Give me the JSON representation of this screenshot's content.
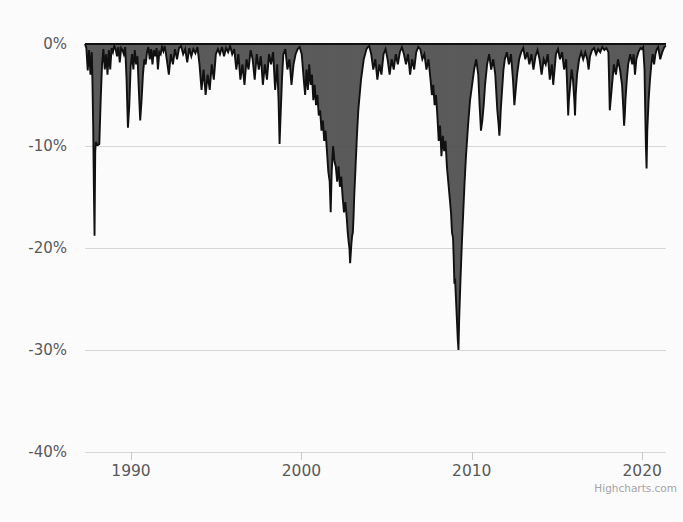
{
  "chart": {
    "credit": "Highcharts.com",
    "background_color": "#fdfdfd",
    "area_fill_color": "#4d4d4d",
    "line_color": "#111111",
    "gridline_color": "#d8d8d8",
    "axis_label_color": "#5a5a5a"
  },
  "chart_data": {
    "type": "area",
    "title": "",
    "subtitle": "",
    "xlabel": "",
    "ylabel": "",
    "xlim": [
      1987.3,
      2021.4
    ],
    "ylim": [
      -40,
      0
    ],
    "x_tick_labels": [
      "1990",
      "2000",
      "2010",
      "2020"
    ],
    "x_ticks": [
      1990,
      2000,
      2010,
      2020
    ],
    "y_tick_labels": [
      "0%",
      "-10%",
      "-20%",
      "-30%",
      "-40%"
    ],
    "y_ticks": [
      0,
      -10,
      -20,
      -30,
      -40
    ],
    "grid": "horizontal",
    "legend": "none",
    "series": [
      {
        "name": "Drawdown",
        "x": [
          1987.3,
          1987.38,
          1987.46,
          1987.54,
          1987.62,
          1987.7,
          1987.74,
          1987.78,
          1987.82,
          1987.86,
          1987.9,
          1987.94,
          1987.98,
          1988.06,
          1988.14,
          1988.22,
          1988.3,
          1988.38,
          1988.46,
          1988.54,
          1988.62,
          1988.7,
          1988.78,
          1988.86,
          1988.94,
          1989.02,
          1989.1,
          1989.18,
          1989.26,
          1989.34,
          1989.42,
          1989.5,
          1989.58,
          1989.66,
          1989.74,
          1989.82,
          1989.9,
          1989.98,
          1990.06,
          1990.14,
          1990.22,
          1990.3,
          1990.38,
          1990.46,
          1990.54,
          1990.62,
          1990.7,
          1990.78,
          1990.86,
          1990.94,
          1991.02,
          1991.1,
          1991.18,
          1991.26,
          1991.34,
          1991.42,
          1991.5,
          1991.58,
          1991.66,
          1991.74,
          1991.82,
          1991.9,
          1991.98,
          1992.1,
          1992.22,
          1992.34,
          1992.46,
          1992.58,
          1992.7,
          1992.82,
          1992.94,
          1993.06,
          1993.18,
          1993.3,
          1993.42,
          1993.54,
          1993.66,
          1993.78,
          1993.9,
          1994.02,
          1994.14,
          1994.26,
          1994.38,
          1994.5,
          1994.62,
          1994.74,
          1994.86,
          1994.98,
          1995.1,
          1995.22,
          1995.34,
          1995.46,
          1995.58,
          1995.7,
          1995.82,
          1995.94,
          1996.06,
          1996.18,
          1996.3,
          1996.42,
          1996.54,
          1996.66,
          1996.78,
          1996.9,
          1997.02,
          1997.14,
          1997.26,
          1997.38,
          1997.5,
          1997.62,
          1997.74,
          1997.86,
          1997.98,
          1998.1,
          1998.22,
          1998.34,
          1998.46,
          1998.58,
          1998.66,
          1998.72,
          1998.78,
          1998.86,
          1998.94,
          1999.06,
          1999.18,
          1999.3,
          1999.42,
          1999.54,
          1999.66,
          1999.78,
          1999.9,
          2000.02,
          2000.14,
          2000.22,
          2000.3,
          2000.38,
          2000.46,
          2000.54,
          2000.62,
          2000.7,
          2000.78,
          2000.86,
          2000.94,
          2001.02,
          2001.1,
          2001.18,
          2001.26,
          2001.34,
          2001.42,
          2001.5,
          2001.58,
          2001.66,
          2001.72,
          2001.78,
          2001.86,
          2001.94,
          2002.02,
          2002.1,
          2002.18,
          2002.26,
          2002.34,
          2002.42,
          2002.5,
          2002.58,
          2002.66,
          2002.72,
          2002.78,
          2002.82,
          2002.86,
          2002.9,
          2002.94,
          2002.98,
          2003.02,
          2003.06,
          2003.1,
          2003.14,
          2003.18,
          2003.26,
          2003.34,
          2003.42,
          2003.5,
          2003.58,
          2003.66,
          2003.74,
          2003.82,
          2003.9,
          2003.98,
          2004.1,
          2004.22,
          2004.34,
          2004.46,
          2004.58,
          2004.7,
          2004.82,
          2004.94,
          2005.06,
          2005.18,
          2005.3,
          2005.42,
          2005.54,
          2005.66,
          2005.78,
          2005.9,
          2006.02,
          2006.14,
          2006.26,
          2006.38,
          2006.5,
          2006.62,
          2006.74,
          2006.86,
          2006.98,
          2007.1,
          2007.22,
          2007.34,
          2007.46,
          2007.58,
          2007.66,
          2007.74,
          2007.82,
          2007.9,
          2007.98,
          2008.06,
          2008.14,
          2008.22,
          2008.3,
          2008.38,
          2008.46,
          2008.54,
          2008.62,
          2008.7,
          2008.78,
          2008.84,
          2008.9,
          2008.94,
          2008.98,
          2009.02,
          2009.06,
          2009.1,
          2009.14,
          2009.18,
          2009.22,
          2009.26,
          2009.34,
          2009.42,
          2009.5,
          2009.58,
          2009.66,
          2009.78,
          2009.9,
          2010.02,
          2010.14,
          2010.26,
          2010.38,
          2010.46,
          2010.54,
          2010.62,
          2010.7,
          2010.78,
          2010.9,
          2011.02,
          2011.14,
          2011.26,
          2011.38,
          2011.5,
          2011.58,
          2011.62,
          2011.66,
          2011.7,
          2011.78,
          2011.86,
          2011.94,
          2012.06,
          2012.18,
          2012.3,
          2012.42,
          2012.5,
          2012.58,
          2012.66,
          2012.78,
          2012.9,
          2013.02,
          2013.14,
          2013.26,
          2013.38,
          2013.5,
          2013.62,
          2013.74,
          2013.86,
          2013.98,
          2014.1,
          2014.22,
          2014.34,
          2014.46,
          2014.58,
          2014.7,
          2014.78,
          2014.86,
          2014.94,
          2015.06,
          2015.18,
          2015.3,
          2015.42,
          2015.54,
          2015.62,
          2015.66,
          2015.7,
          2015.78,
          2015.86,
          2015.94,
          2016.02,
          2016.06,
          2016.1,
          2016.18,
          2016.3,
          2016.42,
          2016.54,
          2016.66,
          2016.78,
          2016.86,
          2016.94,
          2017.06,
          2017.18,
          2017.3,
          2017.42,
          2017.54,
          2017.66,
          2017.78,
          2017.9,
          2018.02,
          2018.06,
          2018.1,
          2018.18,
          2018.26,
          2018.34,
          2018.46,
          2018.58,
          2018.7,
          2018.82,
          2018.9,
          2018.94,
          2018.98,
          2019.02,
          2019.1,
          2019.18,
          2019.3,
          2019.42,
          2019.5,
          2019.58,
          2019.66,
          2019.78,
          2019.9,
          2019.98,
          2020.06,
          2020.14,
          2020.18,
          2020.22,
          2020.26,
          2020.3,
          2020.38,
          2020.46,
          2020.54,
          2020.62,
          2020.7,
          2020.78,
          2020.86,
          2020.94,
          2021.06,
          2021.18,
          2021.3,
          2021.4
        ],
        "values": [
          0.0,
          -0.4,
          -2.6,
          -0.6,
          -3.0,
          -0.8,
          -4.0,
          -8.0,
          -14.0,
          -18.8,
          -10.5,
          -9.6,
          -9.8,
          -9.9,
          -9.8,
          -5.5,
          -2.0,
          -0.5,
          -2.5,
          -1.0,
          -3.0,
          -0.6,
          -2.5,
          -0.4,
          -0.8,
          -0.2,
          -0.5,
          -1.2,
          -0.3,
          -1.8,
          -0.4,
          -0.6,
          -1.0,
          -0.3,
          -3.5,
          -8.2,
          -6.0,
          -2.2,
          -1.0,
          -2.5,
          -0.6,
          -2.0,
          -1.2,
          -4.5,
          -7.5,
          -5.5,
          -3.0,
          -1.5,
          -2.0,
          -0.8,
          -0.3,
          -1.5,
          -0.5,
          -2.0,
          -0.6,
          -1.2,
          -0.4,
          -2.5,
          -0.8,
          -1.0,
          -0.3,
          -0.7,
          -0.2,
          -1.5,
          -3.0,
          -1.0,
          -2.0,
          -0.5,
          -1.5,
          -0.4,
          -0.2,
          -1.0,
          -0.5,
          -1.8,
          -0.4,
          -1.2,
          -0.5,
          -0.9,
          -0.3,
          -2.0,
          -4.5,
          -2.5,
          -5.0,
          -3.0,
          -4.5,
          -2.0,
          -3.5,
          -1.0,
          -0.5,
          -1.0,
          -0.3,
          -1.2,
          -0.4,
          -0.8,
          -0.2,
          -1.0,
          -0.5,
          -2.5,
          -1.0,
          -3.5,
          -2.0,
          -4.0,
          -1.5,
          -2.5,
          -0.6,
          -1.5,
          -3.5,
          -1.0,
          -2.5,
          -1.2,
          -4.0,
          -2.0,
          -3.5,
          -1.0,
          -2.0,
          -0.8,
          -4.5,
          -2.0,
          -5.5,
          -9.8,
          -7.0,
          -3.5,
          -1.0,
          -0.5,
          -2.5,
          -1.5,
          -4.0,
          -2.0,
          -1.0,
          -0.5,
          -0.3,
          -1.0,
          -3.5,
          -5.0,
          -2.5,
          -4.5,
          -2.0,
          -4.0,
          -3.0,
          -5.5,
          -4.0,
          -6.0,
          -5.0,
          -7.0,
          -6.5,
          -8.5,
          -7.5,
          -9.5,
          -8.5,
          -10.5,
          -12.5,
          -13.5,
          -16.5,
          -12.5,
          -10.0,
          -11.5,
          -12.0,
          -13.5,
          -12.0,
          -14.0,
          -13.0,
          -15.0,
          -16.5,
          -15.5,
          -17.0,
          -18.5,
          -19.5,
          -20.0,
          -21.5,
          -20.5,
          -19.5,
          -18.8,
          -18.5,
          -17.0,
          -15.0,
          -13.5,
          -12.0,
          -9.0,
          -6.5,
          -5.0,
          -3.5,
          -2.5,
          -1.5,
          -1.0,
          -0.5,
          -0.3,
          -0.2,
          -1.0,
          -2.5,
          -1.5,
          -3.5,
          -2.0,
          -3.0,
          -1.0,
          -0.5,
          -1.5,
          -3.0,
          -1.5,
          -2.5,
          -1.0,
          -2.0,
          -0.8,
          -0.3,
          -1.0,
          -2.0,
          -1.0,
          -3.0,
          -1.5,
          -2.5,
          -0.8,
          -0.3,
          -0.5,
          -1.5,
          -1.0,
          -2.5,
          -1.5,
          -3.5,
          -5.0,
          -4.0,
          -6.0,
          -5.0,
          -7.0,
          -9.5,
          -8.0,
          -11.0,
          -9.0,
          -10.5,
          -9.5,
          -12.0,
          -13.5,
          -15.0,
          -16.5,
          -18.5,
          -19.0,
          -21.0,
          -23.5,
          -23.0,
          -24.5,
          -26.0,
          -27.5,
          -29.0,
          -30.0,
          -27.0,
          -23.0,
          -19.5,
          -16.5,
          -13.5,
          -11.0,
          -8.0,
          -5.5,
          -4.0,
          -2.5,
          -1.5,
          -3.0,
          -6.0,
          -8.5,
          -7.5,
          -6.0,
          -4.0,
          -2.0,
          -1.0,
          -2.5,
          -1.5,
          -3.0,
          -6.5,
          -8.0,
          -9.0,
          -8.0,
          -6.5,
          -4.5,
          -2.5,
          -1.5,
          -0.8,
          -2.0,
          -1.0,
          -3.5,
          -6.0,
          -4.5,
          -3.0,
          -1.5,
          -0.8,
          -0.4,
          -1.5,
          -0.8,
          -2.0,
          -1.0,
          -2.5,
          -1.2,
          -0.6,
          -1.5,
          -3.0,
          -1.5,
          -2.0,
          -1.0,
          -3.5,
          -2.0,
          -4.0,
          -2.5,
          -1.0,
          -0.5,
          -1.5,
          -0.8,
          -2.5,
          -1.5,
          -5.0,
          -7.0,
          -5.5,
          -4.0,
          -2.5,
          -3.5,
          -5.5,
          -7.0,
          -5.0,
          -3.0,
          -1.5,
          -0.8,
          -1.5,
          -0.8,
          -1.5,
          -2.5,
          -1.2,
          -0.6,
          -0.4,
          -1.0,
          -0.5,
          -0.8,
          -0.3,
          -0.6,
          -0.4,
          -0.8,
          -3.5,
          -6.5,
          -5.0,
          -3.5,
          -2.0,
          -3.0,
          -1.5,
          -2.5,
          -4.0,
          -6.5,
          -8.0,
          -7.0,
          -5.5,
          -3.5,
          -2.0,
          -1.0,
          -2.0,
          -1.0,
          -3.0,
          -1.5,
          -0.8,
          -0.4,
          -0.5,
          -0.3,
          -2.5,
          -6.5,
          -10.0,
          -12.2,
          -8.5,
          -5.5,
          -3.5,
          -2.0,
          -1.0,
          -2.0,
          -1.0,
          -0.5,
          -0.3,
          -1.5,
          -0.8,
          -0.3,
          -0.2
        ]
      }
    ],
    "annotations": [
      {
        "label": "1987 crash trough",
        "x": 1987.86,
        "y": -18.8
      },
      {
        "label": "1998 trough",
        "x": 1998.72,
        "y": -9.8
      },
      {
        "label": "dot-com trough",
        "x": 2002.34,
        "y": -21.5
      },
      {
        "label": "GFC trough",
        "x": 2009.22,
        "y": -30.0
      },
      {
        "label": "COVID trough",
        "x": 2020.18,
        "y": -12.2
      }
    ]
  }
}
